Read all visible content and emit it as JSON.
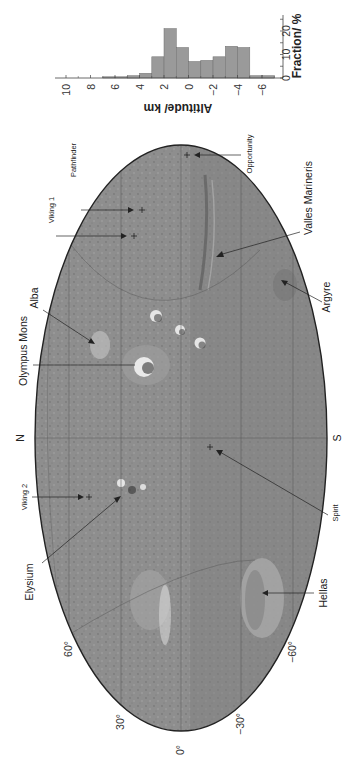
{
  "figure": {
    "orientation": "rotated-90-ccw",
    "background": "#ffffff"
  },
  "map": {
    "projection": "mollweide-style ellipse",
    "fill_color": "#8e8e8e",
    "outline_color": "#222222",
    "north_label": "N",
    "south_label": "S",
    "longitude_labels": [
      "0°",
      "30°",
      "60°",
      "−30°",
      "−60°"
    ],
    "features": [
      {
        "name": "Olympus Mons",
        "type": "volcano"
      },
      {
        "name": "Alba",
        "type": "volcano"
      },
      {
        "name": "Elysium",
        "type": "volcano"
      },
      {
        "name": "Valles Marineris",
        "type": "canyon"
      },
      {
        "name": "Argyre",
        "type": "basin"
      },
      {
        "name": "Hellas",
        "type": "basin"
      }
    ],
    "landing_sites": [
      {
        "name": "Viking 1"
      },
      {
        "name": "Pathfinder"
      },
      {
        "name": "Opportunity"
      },
      {
        "name": "Viking 2"
      },
      {
        "name": "Spirit"
      }
    ]
  },
  "chart_data": {
    "type": "bar",
    "title": "",
    "xlabel": "Altitude/ km",
    "ylabel": "Fraction/ %",
    "orientation_note": "histogram drawn rotated; altitude axis horizontal (reversed, 10 at left to −6 at right), fraction axis vertical",
    "bin_edges_km": [
      7,
      6,
      5,
      4,
      3,
      2,
      1,
      0,
      -1,
      -2,
      -3,
      -4,
      -5,
      -6,
      -7
    ],
    "categories": [
      "7 to 6",
      "6 to 5",
      "5 to 4",
      "4 to 3",
      "3 to 2",
      "2 to 1",
      "1 to 0",
      "0 to −1",
      "−1 to −2",
      "−2 to −3",
      "−3 to −4",
      "−4 to −5",
      "−5 to −6",
      "−6 to −7"
    ],
    "values": [
      0.5,
      0.5,
      1,
      2,
      9,
      21,
      13,
      7,
      7.5,
      9,
      13.5,
      13,
      1,
      1
    ],
    "altitude_ticks": [
      "10",
      "8",
      "6",
      "4",
      "2",
      "0",
      "−2",
      "−4",
      "−6"
    ],
    "fraction_ticks": [
      "0",
      "10",
      "20"
    ],
    "xlim": [
      10.5,
      -7
    ],
    "ylim": [
      0,
      27
    ],
    "grid": false,
    "bar_color": "#9a9a9a"
  }
}
